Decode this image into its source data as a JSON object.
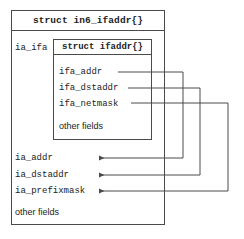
{
  "diagram": {
    "title": "struct in6_ifaddr{}",
    "outer_struct": {
      "pointer_label": "ia_ifa",
      "fields": [
        {
          "name": "ia_addr"
        },
        {
          "name": "ia_dstaddr"
        },
        {
          "name": "ia_prefixmask"
        }
      ],
      "other_fields_label": "other fields"
    },
    "inner_struct": {
      "title": "struct ifaddr{}",
      "fields": [
        {
          "name": "ifa_addr"
        },
        {
          "name": "ifa_dstaddr"
        },
        {
          "name": "ifa_netmask"
        }
      ],
      "other_fields_label": "other fields"
    },
    "connections": [
      {
        "from": "ifa_addr",
        "to": "ia_addr"
      },
      {
        "from": "ifa_dstaddr",
        "to": "ia_dstaddr"
      },
      {
        "from": "ifa_netmask",
        "to": "ia_prefixmask"
      }
    ],
    "colors": {
      "line": "#4a4a4a",
      "text": "#222222",
      "background": "#ffffff"
    }
  }
}
